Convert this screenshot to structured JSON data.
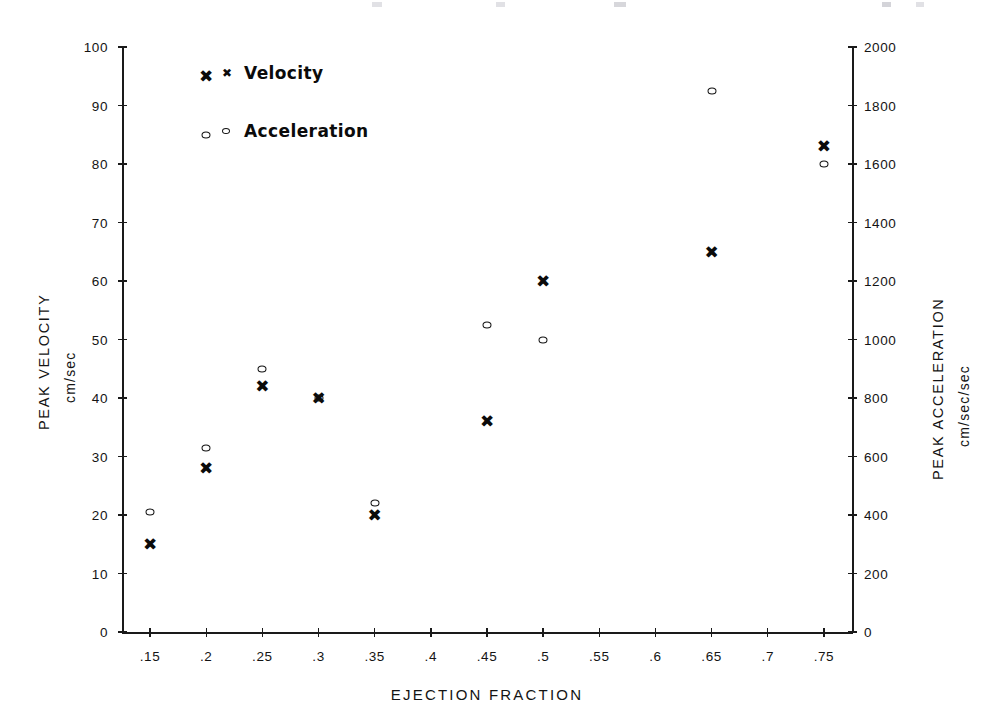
{
  "chart_data": {
    "type": "scatter",
    "title": "",
    "xlabel": "EJECTION FRACTION",
    "ylabel": "PEAK VELOCITY",
    "ylabel_units": "cm/sec",
    "y2label": "PEAK ACCELERATION",
    "y2label_units": "cm/sec/sec",
    "xlim": [
      0.125,
      0.775
    ],
    "ylim": [
      0,
      100
    ],
    "y2lim": [
      0,
      2000
    ],
    "grid": false,
    "legend_position": "upper-left-inside",
    "xticks": [
      ".15",
      ".2",
      ".25",
      ".3",
      ".35",
      ".4",
      ".45",
      ".5",
      ".55",
      ".6",
      ".65",
      ".7",
      ".75"
    ],
    "xtick_values": [
      0.15,
      0.2,
      0.25,
      0.3,
      0.35,
      0.4,
      0.45,
      0.5,
      0.55,
      0.6,
      0.65,
      0.7,
      0.75
    ],
    "yticks": [
      "0",
      "10",
      "20",
      "30",
      "40",
      "50",
      "60",
      "70",
      "80",
      "90",
      "100"
    ],
    "ytick_values": [
      0,
      10,
      20,
      30,
      40,
      50,
      60,
      70,
      80,
      90,
      100
    ],
    "y2ticks": [
      "0",
      "200",
      "400",
      "600",
      "800",
      "1000",
      "1200",
      "1400",
      "1600",
      "1800",
      "2000"
    ],
    "y2tick_values": [
      0,
      200,
      400,
      600,
      800,
      1000,
      1200,
      1400,
      1600,
      1800,
      2000
    ],
    "series": [
      {
        "name": "Velocity",
        "marker": "x",
        "axis": "left",
        "units": "cm/sec",
        "x": [
          0.15,
          0.2,
          0.2,
          0.25,
          0.3,
          0.35,
          0.45,
          0.5,
          0.65,
          0.75
        ],
        "values": [
          15,
          95,
          28,
          42,
          40,
          20,
          36,
          60,
          65,
          83
        ]
      },
      {
        "name": "Acceleration",
        "marker": "o",
        "axis": "right",
        "units": "cm/sec/sec",
        "x": [
          0.15,
          0.2,
          0.2,
          0.25,
          0.3,
          0.35,
          0.45,
          0.5,
          0.65,
          0.75
        ],
        "values": [
          410,
          1700,
          630,
          900,
          800,
          440,
          1050,
          1000,
          1850,
          1600
        ]
      }
    ]
  },
  "legend": {
    "items": [
      {
        "label": "Velocity",
        "marker": "x"
      },
      {
        "label": "Acceleration",
        "marker": "o"
      }
    ]
  },
  "axes": {
    "left_title": "PEAK VELOCITY",
    "left_units": "cm/sec",
    "right_title": "PEAK ACCELERATION",
    "right_units": "cm/sec/sec",
    "bottom_title": "EJECTION FRACTION"
  },
  "colors": {
    "ink": "#111111",
    "background": "#ffffff"
  }
}
